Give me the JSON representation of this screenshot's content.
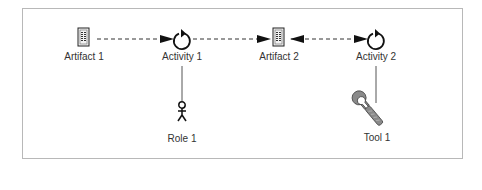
{
  "diagram": {
    "nodes": [
      {
        "id": "artifact1",
        "type": "artifact",
        "label": "Artifact 1"
      },
      {
        "id": "activity1",
        "type": "activity",
        "label": "Activity 1"
      },
      {
        "id": "artifact2",
        "type": "artifact",
        "label": "Artifact 2"
      },
      {
        "id": "activity2",
        "type": "activity",
        "label": "Activity 2"
      },
      {
        "id": "role1",
        "type": "role",
        "label": "Role 1"
      },
      {
        "id": "tool1",
        "type": "tool",
        "label": "Tool 1"
      }
    ],
    "edges": [
      {
        "from": "artifact1",
        "to": "activity1",
        "style": "dashed",
        "arrow": "end"
      },
      {
        "from": "activity1",
        "to": "artifact2",
        "style": "dashed",
        "arrow": "end"
      },
      {
        "from": "artifact2",
        "to": "activity2",
        "style": "dashed",
        "arrow": "both"
      },
      {
        "from": "activity1",
        "to": "role1",
        "style": "solid",
        "arrow": "none"
      },
      {
        "from": "activity2",
        "to": "tool1",
        "style": "solid",
        "arrow": "none"
      }
    ]
  }
}
